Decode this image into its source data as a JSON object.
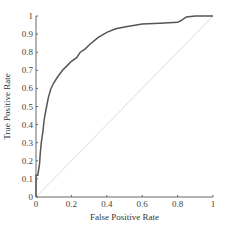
{
  "chart_data": {
    "type": "line",
    "title": "",
    "xlabel": "False Positive Rate",
    "ylabel": "True Positive Rate",
    "xlim": [
      0,
      1
    ],
    "ylim": [
      0,
      1
    ],
    "xticks": [
      "0",
      "0.2",
      "0.4",
      "0.6",
      "0.8",
      "1"
    ],
    "yticks": [
      "0",
      "0.1",
      "0.2",
      "0.3",
      "0.4",
      "0.5",
      "0.6",
      "0.7",
      "0.8",
      "0.9",
      "1"
    ],
    "grid": false,
    "legend": null,
    "series": [
      {
        "name": "ROC curve",
        "color": "#555555",
        "x": [
          0,
          0,
          0.01,
          0.02,
          0.025,
          0.03,
          0.04,
          0.045,
          0.05,
          0.06,
          0.07,
          0.085,
          0.1,
          0.12,
          0.15,
          0.18,
          0.2,
          0.23,
          0.25,
          0.28,
          0.3,
          0.35,
          0.4,
          0.45,
          0.5,
          0.6,
          0.7,
          0.8,
          0.82,
          0.85,
          0.9,
          1.0
        ],
        "y": [
          0,
          0.12,
          0.12,
          0.18,
          0.25,
          0.3,
          0.37,
          0.42,
          0.45,
          0.5,
          0.55,
          0.6,
          0.63,
          0.66,
          0.7,
          0.73,
          0.75,
          0.77,
          0.8,
          0.82,
          0.84,
          0.88,
          0.91,
          0.93,
          0.94,
          0.955,
          0.96,
          0.965,
          0.975,
          0.995,
          1.0,
          1.0
        ]
      },
      {
        "name": "Random classifier",
        "color": "#dddddd",
        "x": [
          0,
          1
        ],
        "y": [
          0,
          1
        ]
      }
    ]
  }
}
